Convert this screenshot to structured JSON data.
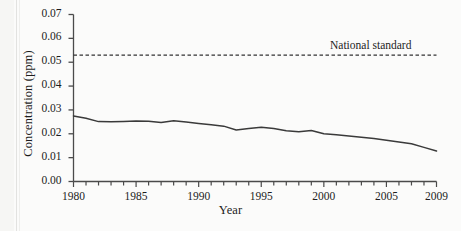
{
  "chart_data": {
    "type": "line",
    "title": "",
    "xlabel": "Year",
    "ylabel": "Concentration (ppm)",
    "xlim": [
      1980,
      2009
    ],
    "ylim": [
      0.0,
      0.07
    ],
    "grid": false,
    "legend": "none",
    "x_tick_labels": [
      "1980",
      "1985",
      "1990",
      "1995",
      "2000",
      "2005",
      "2009"
    ],
    "x_tick_values": [
      1980,
      1985,
      1990,
      1995,
      2000,
      2005,
      2009
    ],
    "x_minor_tick_interval": 1,
    "y_tick_labels": [
      "0.00",
      "0.01",
      "0.02",
      "0.03",
      "0.04",
      "0.05",
      "0.06",
      "0.07"
    ],
    "y_tick_values": [
      0.0,
      0.01,
      0.02,
      0.03,
      0.04,
      0.05,
      0.06,
      0.07
    ],
    "series": [
      {
        "name": "Concentration",
        "style": "solid",
        "color": "#3a3a3a",
        "x": [
          1980,
          1981,
          1982,
          1983,
          1984,
          1985,
          1986,
          1987,
          1988,
          1989,
          1990,
          1991,
          1992,
          1993,
          1994,
          1995,
          1996,
          1997,
          1998,
          1999,
          2000,
          2001,
          2002,
          2003,
          2004,
          2005,
          2006,
          2007,
          2008,
          2009
        ],
        "values": [
          0.0275,
          0.0265,
          0.0251,
          0.025,
          0.0252,
          0.0254,
          0.0253,
          0.0247,
          0.0255,
          0.0249,
          0.0243,
          0.0238,
          0.0232,
          0.0216,
          0.0222,
          0.0227,
          0.0222,
          0.0213,
          0.0209,
          0.0214,
          0.02,
          0.0196,
          0.0191,
          0.0185,
          0.018,
          0.0173,
          0.0166,
          0.0158,
          0.0143,
          0.0128
        ]
      }
    ],
    "reference_lines": [
      {
        "name": "National standard",
        "label": "National standard",
        "value": 0.053,
        "style": "dashed",
        "color": "#333333",
        "orientation": "horizontal"
      }
    ]
  }
}
